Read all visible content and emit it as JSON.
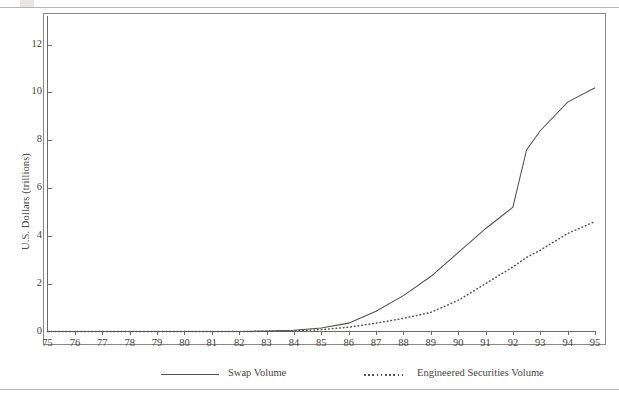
{
  "figure": {
    "y_axis_title": "U.S. Dollars (trillions)"
  },
  "chart_data": {
    "type": "line",
    "title": "",
    "xlabel": "",
    "ylabel": "U.S. Dollars (trillions)",
    "xlim": [
      75,
      95
    ],
    "ylim": [
      0,
      13.2
    ],
    "grid": false,
    "legend_position": "bottom",
    "x_ticks": [
      "75",
      "76",
      "77",
      "78",
      "79",
      "80",
      "81",
      "82",
      "83",
      "84",
      "85",
      "86",
      "87",
      "88",
      "89",
      "90",
      "91",
      "92",
      "93",
      "94",
      "95"
    ],
    "y_ticks": [
      "0",
      "2",
      "4",
      "6",
      "8",
      "10",
      "12"
    ],
    "x": [
      75,
      76,
      77,
      78,
      79,
      80,
      81,
      82,
      83,
      84,
      85,
      86,
      87,
      88,
      89,
      90,
      91,
      92,
      92.5,
      93,
      94,
      95
    ],
    "series": [
      {
        "name": "Swap Volume",
        "style": "solid",
        "values": [
          0,
          0,
          0,
          0,
          0,
          0,
          0,
          0,
          0.02,
          0.05,
          0.15,
          0.35,
          0.85,
          1.5,
          2.3,
          3.3,
          4.3,
          5.2,
          7.6,
          8.4,
          9.6,
          10.2
        ]
      },
      {
        "name": "Engineered Securities Volume",
        "style": "dotted",
        "values": [
          0,
          0,
          0,
          0,
          0,
          0,
          0,
          0,
          0.01,
          0.03,
          0.08,
          0.18,
          0.35,
          0.55,
          0.8,
          1.3,
          2.0,
          2.7,
          3.1,
          3.4,
          4.1,
          4.6
        ]
      }
    ],
    "annotations": [
      {
        "id": "risk-controls",
        "arrow_x": 78,
        "items": [
          "Risk controls based",
          "on credit, SMM, and",
          "“honest to God” yields"
        ],
        "bullets": [
          1,
          0,
          0
        ]
      },
      {
        "id": "first-interest-rate",
        "arrow_x": 80,
        "items": [
          "First interest rate and",
          "currency swaps",
          "Swaps priced like",
          "bonds"
        ],
        "bullets": [
          1,
          0,
          1,
          0
        ]
      },
      {
        "id": "first-books",
        "arrow_x": 82.5,
        "items": [
          "First books on",
          "“risk management”",
          "First CMO"
        ],
        "bullets": [
          1,
          0,
          1
        ]
      },
      {
        "id": "first-caps",
        "arrow_x": 84,
        "items": [
          "First caps",
          "and collars"
        ],
        "bullets": [
          1,
          0
        ]
      },
      {
        "id": "risk-management-reports",
        "arrow_x": 85.3,
        "items": [
          "Risk-management",
          "reports",
          "10–year equivalents",
          "(or equivalent futures",
          "contracts)",
          "Limits based on credit"
        ],
        "bullets": [
          1,
          0,
          1,
          0,
          0,
          1
        ]
      },
      {
        "id": "option-adjusted-spreads",
        "arrow_x": 86.8,
        "items": [
          "Option-",
          "adjusted",
          "spreads",
          "and",
          "effective",
          "duration"
        ],
        "bullets": [
          1,
          0,
          0,
          0,
          0,
          0
        ]
      },
      {
        "id": "limits-on-greeks",
        "arrow_x": 87.8,
        "items": [
          "Limits on “Greeks”",
          "Delta-equivalent",
          "hedging",
          "First burnout",
          "prepayment models",
          "Reserves on credit"
        ],
        "bullets": [
          1,
          1,
          0,
          1,
          0,
          1
        ]
      },
      {
        "id": "limits-on-exposure",
        "arrow_x": 89,
        "items": [
          "Limits on exposure by",
          "duration buckets"
        ],
        "bullets": [
          1,
          0
        ]
      },
      {
        "id": "stress-testing",
        "arrow_x": 91,
        "items": [
          "Stress",
          "testing"
        ],
        "bullets": [
          1,
          0
        ]
      },
      {
        "id": "reserves-for-liquidity",
        "arrow_x": 92.1,
        "items": [
          "Reserves for liquidity,",
          "administration, etc.",
          "First inverses"
        ],
        "bullets": [
          1,
          0,
          1
        ]
      },
      {
        "id": "value-at-risk",
        "arrow_x": 93.7,
        "items": [
          "Value at risk",
          "Limits on complexity",
          "Model reserves"
        ],
        "bullets": [
          1,
          1,
          1
        ]
      }
    ],
    "legend": [
      {
        "label": "Swap Volume",
        "style": "solid"
      },
      {
        "label": "Engineered Securities Volume",
        "style": "dotted"
      }
    ]
  }
}
